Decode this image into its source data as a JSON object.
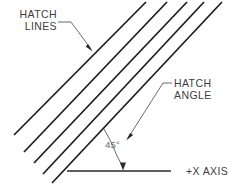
{
  "figure": {
    "background_color": "#ffffff",
    "width": 230,
    "height": 184
  },
  "labels": {
    "hatch_lines_line1": "HATCH",
    "hatch_lines_line2": "LINES",
    "hatch_angle_line1": "HATCH",
    "hatch_angle_line2": "ANGLE",
    "angle_value": "45°",
    "x_axis": "+X  AXIS"
  },
  "colors": {
    "hatch_stroke": "#1c1c1c",
    "axis_stroke": "#2a2a2a",
    "leader_stroke": "#5a5a5a",
    "label_text": "#3d3d3d",
    "dim_text": "#6a6a6a",
    "arrowhead_fill": "#2b2b2b"
  },
  "geometry": {
    "hatch_angle_degrees": 45,
    "hatch_line_count": 5,
    "hatch_lines": [
      {
        "x1": 14,
        "y1": 135,
        "x2": 146,
        "y2": 2
      },
      {
        "x1": 24,
        "y1": 152,
        "x2": 167,
        "y2": 2
      },
      {
        "x1": 34,
        "y1": 163,
        "x2": 187,
        "y2": 2
      },
      {
        "x1": 43,
        "y1": 174,
        "x2": 204,
        "y2": 2
      },
      {
        "x1": 52,
        "y1": 183,
        "x2": 222,
        "y2": 2
      }
    ],
    "x_axis_line": {
      "x1": 67,
      "y1": 171,
      "x2": 171,
      "y2": 171
    },
    "angle_arc": {
      "cx": 123,
      "cy": 171,
      "radius": 58,
      "start_deg": 45,
      "end_deg": 90
    }
  }
}
